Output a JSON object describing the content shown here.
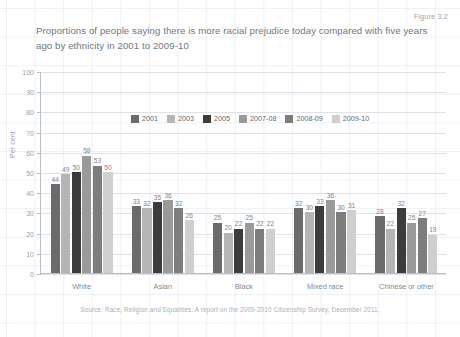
{
  "figure_number": "Figure 3.2",
  "title": "Proportions of people saying there is more racial prejudice today compared with five years ago by ethnicity in 2001 to 2009-10",
  "source_note": "Source: Race, Religion and Equalities: A report on the 2009-2010 Citizenship Survey, December 2011,",
  "y_axis_title": "Per cent",
  "y_ticks": [
    "100",
    "90",
    "80",
    "70",
    "60",
    "50",
    "40",
    "30",
    "20",
    "10",
    "0"
  ],
  "legend": {
    "position": "top-center",
    "items": [
      {
        "label": "2001",
        "color": "#6b6b6b"
      },
      {
        "label": "2003",
        "color": "#b5b5b5"
      },
      {
        "label": "2005",
        "color": "#3c3c3c"
      },
      {
        "label": "2007-08",
        "color": "#9a9a9a"
      },
      {
        "label": "2008-09",
        "color": "#7d7d7d"
      },
      {
        "label": "2009-10",
        "color": "#cfcfcf"
      }
    ]
  },
  "chart_data": {
    "type": "bar",
    "title": "Proportions of people saying there is more racial prejudice today compared with five years ago by ethnicity in 2001 to 2009-10",
    "xlabel": "",
    "ylabel": "Per cent",
    "ylim": [
      0,
      100
    ],
    "ytick_step": 10,
    "grid": true,
    "categories": [
      "White",
      "Asian",
      "Black",
      "Mixed race",
      "Chinese or other"
    ],
    "series": [
      {
        "name": "2001",
        "color": "#6b6b6b",
        "values": [
          44,
          33,
          25,
          32,
          28
        ]
      },
      {
        "name": "2003",
        "color": "#b5b5b5",
        "values": [
          49,
          32,
          20,
          30,
          22
        ]
      },
      {
        "name": "2005",
        "color": "#3c3c3c",
        "values": [
          50,
          35,
          22,
          33,
          32
        ]
      },
      {
        "name": "2007-08",
        "color": "#9a9a9a",
        "values": [
          58,
          36,
          25,
          36,
          25
        ]
      },
      {
        "name": "2008-09",
        "color": "#7d7d7d",
        "values": [
          53,
          32,
          22,
          30,
          27
        ]
      },
      {
        "name": "2009-10",
        "color": "#cfcfcf",
        "values": [
          50,
          26,
          22,
          31,
          19
        ]
      }
    ]
  }
}
